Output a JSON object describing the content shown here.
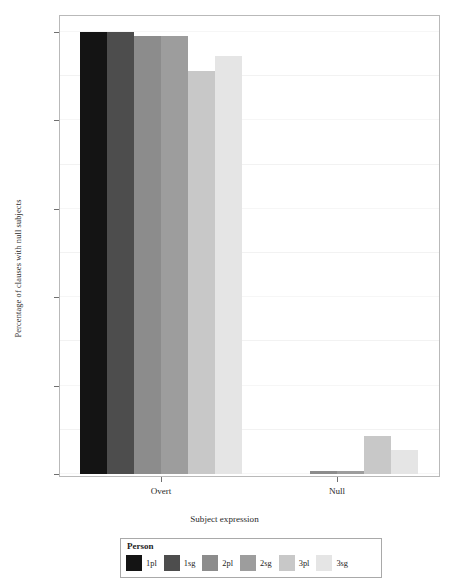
{
  "chart_data": {
    "type": "bar",
    "title": "",
    "subtitle": "",
    "xlabel": "Subject expression",
    "ylabel": "Percentage of clauses with null subjects",
    "categories": [
      "Overt",
      "Null"
    ],
    "ylim": [
      0,
      100
    ],
    "ytick_labels": [
      "0%",
      "20%",
      "40%",
      "60%",
      "80%",
      "100%"
    ],
    "ytick_values": [
      0,
      20,
      40,
      60,
      80,
      100
    ],
    "grid": true,
    "legend_position": "bottom",
    "legend_title": "Person",
    "series": [
      {
        "name": "1pl",
        "color": "#141414",
        "values": [
          100.0,
          0.0
        ]
      },
      {
        "name": "1sg",
        "color": "#4d4d4d",
        "values": [
          100.0,
          0.0
        ]
      },
      {
        "name": "2pl",
        "color": "#8c8c8c",
        "values": [
          99.2,
          0.7
        ]
      },
      {
        "name": "2sg",
        "color": "#9d9d9d",
        "values": [
          99.2,
          0.7
        ]
      },
      {
        "name": "3pl",
        "color": "#c8c8c8",
        "values": [
          91.2,
          8.5
        ]
      },
      {
        "name": "3sg",
        "color": "#e5e5e5",
        "values": [
          94.5,
          5.5
        ]
      }
    ]
  },
  "axes": {
    "x_title": "Subject expression",
    "y_title": "Percentage of clauses with null subjects",
    "x_tick_labels": [
      "Overt",
      "Null"
    ],
    "y_tick_labels": [
      "100%",
      "80%",
      "60%",
      "40%",
      "20%",
      "0%"
    ]
  },
  "legend": {
    "title": "Person",
    "entries": [
      {
        "label": "1pl",
        "color": "#141414"
      },
      {
        "label": "1sg",
        "color": "#4d4d4d"
      },
      {
        "label": "2pl",
        "color": "#8c8c8c"
      },
      {
        "label": "2sg",
        "color": "#9d9d9d"
      },
      {
        "label": "3pl",
        "color": "#c8c8c8"
      },
      {
        "label": "3sg",
        "color": "#e5e5e5"
      }
    ]
  },
  "style": {
    "panel_background": "#ffffff",
    "panel_border": "#b9b9b9",
    "grid_color": "#f2f2f2",
    "text_color": "#222222"
  }
}
